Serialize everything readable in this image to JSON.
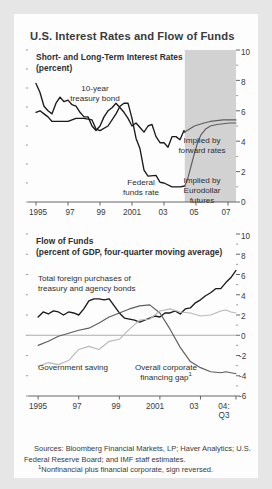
{
  "figure": {
    "title": "U.S. Interest Rates and Flow of Funds",
    "background": "#e6e6e6",
    "card_background": "#fdfdfd",
    "shade_color": "#d2d2d2",
    "series_colors": {
      "dark": "#1a1a1a",
      "mid": "#5e5e5e",
      "light": "#b9b9b9"
    }
  },
  "sources": {
    "line1": "Sources: Bloomberg Financial Markets, LP; Haver Analytics; U.S. Federal Reserve Board; and IMF staff estimates.",
    "line2_marker": "1",
    "line2": "Nonfinancial plus financial corporate, sign reversed."
  },
  "chart_data": [
    {
      "type": "line",
      "title": "Short- and Long-Term Interest Rates",
      "subtitle": "(percent)",
      "xlabel": "",
      "ylabel": "",
      "ylim": [
        0,
        10
      ],
      "yticks": [
        0,
        2,
        4,
        6,
        8,
        10
      ],
      "ytick_labels": [
        "0",
        "2",
        "4",
        "6",
        "8",
        "10"
      ],
      "minor_yticks": [
        1,
        3,
        5,
        7,
        9
      ],
      "xlim": [
        1994.5,
        2007.5
      ],
      "xticks": [
        1995,
        1997,
        1999,
        2001,
        2003,
        2005,
        2007
      ],
      "xtick_labels": [
        "1995",
        "97",
        "99",
        "2001",
        "03",
        "05",
        "07"
      ],
      "grid": false,
      "legend_position": "inline-annotations",
      "annotations": [
        {
          "text": "10-year treasury bond",
          "x": 1996.5,
          "y": 8.5
        },
        {
          "text": "Federal funds rate",
          "x": 2001.6,
          "y": 1.9
        },
        {
          "text": "Implied by forward rates",
          "x": 2005.6,
          "y": 6.3
        },
        {
          "text": "Implied by Eurodollar futures",
          "x": 2005.7,
          "y": 2.6
        }
      ],
      "shaded_region": {
        "from": 2004.3,
        "to": 2007.5,
        "label": "projection"
      },
      "series": [
        {
          "name": "10-year treasury bond",
          "color": "#1a1a1a",
          "x": [
            1995.0,
            1995.25,
            1995.5,
            1995.75,
            1996.0,
            1996.25,
            1996.5,
            1996.75,
            1997.0,
            1997.25,
            1997.5,
            1997.75,
            1998.0,
            1998.25,
            1998.5,
            1998.75,
            1999.0,
            1999.25,
            1999.5,
            1999.75,
            2000.0,
            2000.25,
            2000.5,
            2000.75,
            2001.0,
            2001.25,
            2001.5,
            2001.75,
            2002.0,
            2002.25,
            2002.5,
            2002.75,
            2003.0,
            2003.25,
            2003.5,
            2003.75,
            2004.0,
            2004.25,
            2004.3
          ],
          "values": [
            7.8,
            7.2,
            6.3,
            6.0,
            5.8,
            6.5,
            6.9,
            6.6,
            6.7,
            6.4,
            6.3,
            5.9,
            5.6,
            5.6,
            5.0,
            4.7,
            5.0,
            5.6,
            6.0,
            6.2,
            6.5,
            6.2,
            5.9,
            5.5,
            5.0,
            5.2,
            4.9,
            4.6,
            5.0,
            5.1,
            4.3,
            3.9,
            3.9,
            3.6,
            4.3,
            4.3,
            4.1,
            4.7,
            4.6
          ]
        },
        {
          "name": "Federal funds rate",
          "color": "#1a1a1a",
          "x": [
            1995.0,
            1995.25,
            1995.5,
            1995.75,
            1996.0,
            1996.5,
            1997.0,
            1997.5,
            1998.0,
            1998.5,
            1998.75,
            1999.0,
            1999.5,
            2000.0,
            2000.25,
            2000.5,
            2000.75,
            2001.0,
            2001.25,
            2001.5,
            2001.75,
            2002.0,
            2002.5,
            2002.75,
            2003.0,
            2003.5,
            2003.75,
            2004.0,
            2004.3
          ],
          "values": [
            5.9,
            6.0,
            5.8,
            5.6,
            5.3,
            5.3,
            5.3,
            5.5,
            5.5,
            5.4,
            4.8,
            4.7,
            5.0,
            5.8,
            6.3,
            6.5,
            6.5,
            5.5,
            4.2,
            3.5,
            2.1,
            1.7,
            1.75,
            1.3,
            1.25,
            1.0,
            1.0,
            1.0,
            1.05
          ]
        },
        {
          "name": "Implied by forward rates",
          "color": "#5e5e5e",
          "x": [
            2004.3,
            2004.6,
            2004.9,
            2005.2,
            2005.5,
            2005.9,
            2006.3,
            2006.7,
            2007.1,
            2007.5
          ],
          "values": [
            4.6,
            4.8,
            5.0,
            5.1,
            5.2,
            5.3,
            5.35,
            5.4,
            5.4,
            5.4
          ]
        },
        {
          "name": "Implied by Eurodollar futures",
          "color": "#5e5e5e",
          "x": [
            2004.3,
            2004.5,
            2004.7,
            2004.9,
            2005.1,
            2005.3,
            2005.6,
            2005.9,
            2006.3,
            2006.7,
            2007.1,
            2007.5
          ],
          "values": [
            1.05,
            1.6,
            2.4,
            3.2,
            3.9,
            4.4,
            4.8,
            5.0,
            5.1,
            5.15,
            5.2,
            5.2
          ]
        }
      ]
    },
    {
      "type": "line",
      "title": "Flow of Funds",
      "subtitle": "(percent of GDP, four-quarter moving average)",
      "xlabel": "",
      "ylabel": "",
      "ylim": [
        -6,
        10
      ],
      "yticks": [
        -6,
        -4,
        -2,
        0,
        2,
        4,
        6,
        8,
        10
      ],
      "ytick_labels": [
        "-6",
        "-4",
        "-2",
        "0",
        "2",
        "4",
        "6",
        "8",
        "10"
      ],
      "minor_yticks": [
        -5,
        -3,
        -1,
        1,
        3,
        5,
        7,
        9
      ],
      "xlim": [
        1994.5,
        2004.75
      ],
      "xticks": [
        1995,
        1997,
        1999,
        2001,
        2003,
        2004.75
      ],
      "xtick_labels": [
        "1995",
        "97",
        "99",
        "2001",
        "03",
        "04:\nQ3"
      ],
      "grid": false,
      "zero_line": true,
      "legend_position": "inline-annotations",
      "annotations": [
        {
          "text": "Total foreign purchases of treasury and agency bonds",
          "x": 1997.4,
          "y": 5.6
        },
        {
          "text": "Government saving",
          "x": 1996.3,
          "y": -3.6
        },
        {
          "text": "Overall corporate financing gap",
          "x": 2000.6,
          "y": -3.6,
          "marker": "1"
        }
      ],
      "series": [
        {
          "name": "Total foreign purchases of treasury and agency bonds",
          "color": "#1a1a1a",
          "x": [
            1995.0,
            1995.25,
            1995.5,
            1995.75,
            1996.0,
            1996.25,
            1996.5,
            1996.75,
            1997.0,
            1997.25,
            1997.5,
            1997.75,
            1998.0,
            1998.25,
            1998.5,
            1998.75,
            1999.0,
            1999.25,
            1999.5,
            1999.75,
            2000.0,
            2000.25,
            2000.5,
            2000.75,
            2001.0,
            2001.25,
            2001.5,
            2001.75,
            2002.0,
            2002.25,
            2002.5,
            2002.75,
            2003.0,
            2003.25,
            2003.5,
            2003.75,
            2004.0,
            2004.25,
            2004.5,
            2004.75
          ],
          "values": [
            1.8,
            2.3,
            2.1,
            2.4,
            2.3,
            2.0,
            2.3,
            2.2,
            2.0,
            2.6,
            3.4,
            3.6,
            3.6,
            3.5,
            3.6,
            2.9,
            2.2,
            1.7,
            1.6,
            1.5,
            1.3,
            1.5,
            1.7,
            1.9,
            1.8,
            2.2,
            2.2,
            2.4,
            2.1,
            2.6,
            2.7,
            3.2,
            3.5,
            3.9,
            4.2,
            4.6,
            4.6,
            5.2,
            5.7,
            6.4
          ]
        },
        {
          "name": "Government saving",
          "color": "#5e5e5e",
          "x": [
            1995.0,
            1995.5,
            1996.0,
            1996.5,
            1997.0,
            1997.5,
            1998.0,
            1998.5,
            1999.0,
            1999.5,
            2000.0,
            2000.5,
            2001.0,
            2001.5,
            2002.0,
            2002.5,
            2003.0,
            2003.5,
            2004.0,
            2004.25,
            2004.5,
            2004.75
          ],
          "values": [
            -1.0,
            -0.6,
            -0.1,
            0.2,
            0.5,
            0.7,
            1.2,
            1.8,
            2.2,
            2.6,
            2.9,
            3.0,
            2.2,
            0.6,
            -1.2,
            -2.6,
            -3.2,
            -3.6,
            -3.7,
            -3.6,
            -3.7,
            -3.8
          ]
        },
        {
          "name": "Overall corporate financing gap",
          "color": "#b9b9b9",
          "x": [
            1995.0,
            1995.5,
            1996.0,
            1996.5,
            1997.0,
            1997.5,
            1998.0,
            1998.5,
            1999.0,
            1999.5,
            2000.0,
            2000.5,
            2001.0,
            2001.5,
            2002.0,
            2002.5,
            2003.0,
            2003.5,
            2004.0,
            2004.25,
            2004.5,
            2004.75
          ],
          "values": [
            -3.1,
            -2.7,
            -2.9,
            -2.5,
            -1.4,
            -1.1,
            -1.4,
            -0.6,
            -0.4,
            0.6,
            1.5,
            1.6,
            2.4,
            2.6,
            2.3,
            2.2,
            1.9,
            2.0,
            2.4,
            2.5,
            2.3,
            2.2
          ]
        }
      ]
    }
  ]
}
